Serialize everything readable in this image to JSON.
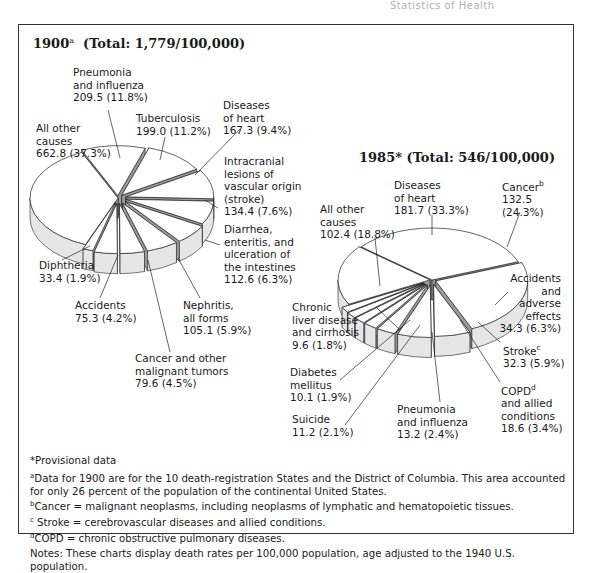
{
  "page_header": "Statistics of Health",
  "chart_data": [
    {
      "type": "pie",
      "title": "1900",
      "title_footnote": "a",
      "subtitle": "(Total: 1,779/100,000)",
      "total": 1779,
      "unit": "deaths per 100,000 population",
      "categories": [
        "All other causes",
        "Pneumonia and influenza",
        "Tuberculosis",
        "Diseases of heart",
        "Intracranial lesions of vascular origin (stroke)",
        "Diarrhea, enteritis, and ulceration of the intestines",
        "Nephritis, all forms",
        "Cancer and other malignant tumors",
        "Accidents",
        "Diphtheria"
      ],
      "values": [
        662.8,
        209.5,
        199.0,
        167.3,
        134.4,
        112.6,
        105.1,
        79.6,
        75.3,
        33.4
      ],
      "percent": [
        37.3,
        11.8,
        11.2,
        9.4,
        7.6,
        6.3,
        5.9,
        4.5,
        4.2,
        1.9
      ],
      "style": "3D exploded pie"
    },
    {
      "type": "pie",
      "title": "1985*",
      "subtitle": "(Total: 546/100,000)",
      "total": 546,
      "unit": "deaths per 100,000 population",
      "categories": [
        "Diseases of heart",
        "Cancer",
        "Accidents and adverse effects",
        "Stroke",
        "COPD and allied conditions",
        "Pneumonia and influenza",
        "Suicide",
        "Diabetes mellitus",
        "Chronic liver disease and cirrhosis",
        "All other causes"
      ],
      "values": [
        181.7,
        132.5,
        34.3,
        32.3,
        18.6,
        13.2,
        11.2,
        10.1,
        9.6,
        102.4
      ],
      "percent": [
        33.3,
        24.3,
        6.3,
        5.9,
        3.4,
        2.4,
        2.1,
        1.9,
        1.8,
        18.8
      ],
      "style": "3D exploded pie"
    }
  ],
  "chart1900": {
    "year": "1900",
    "footnote": "a",
    "total": "(Total: 1,779/100,000)",
    "labels": {
      "pneumonia": "Pneumonia\nand influenza\n209.5 (11.8%)",
      "tuberculosis": "Tuberculosis\n199.0 (11.2%)",
      "heart": "Diseases\nof heart\n167.3 (9.4%)",
      "other": "All other\ncauses\n662.8 (37.3%)",
      "stroke": "Intracranial\nlesions of\nvascular origin\n(stroke)\n134.4 (7.6%)",
      "diarrhea": "Diarrhea,\nenteritis, and\nulceration of\nthe intestines\n112.6 (6.3%)",
      "diphtheria": "Diphtheria\n33.4 (1.9%)",
      "accidents": "Accidents\n75.3 (4.2%)",
      "nephritis": "Nephritis,\nall forms\n105.1 (5.9%)",
      "cancer": "Cancer and other\nmalignant tumors\n79.6 (4.5%)"
    }
  },
  "chart1985": {
    "title": "1985* (Total: 546/100,000)",
    "labels": {
      "heart": "Diseases\nof heart\n181.7 (33.3%)",
      "cancer": "Cancer",
      "cancer_sup": "b",
      "cancer_val": "132.5\n(24.3%)",
      "other": "All other\ncauses\n102.4 (18.8%)",
      "accidents": "Accidents\nand\nadverse\neffects\n34.3 (6.3%)",
      "liver": "Chronic\nliver disease\nand cirrhosis\n9.6 (1.8%)",
      "stroke": "Stroke",
      "stroke_sup": "c",
      "stroke_val": "32.3 (5.9%)",
      "diabetes": "Diabetes\nmellitus\n10.1 (1.9%)",
      "copd": "COPD",
      "copd_sup": "d",
      "copd_val": "and allied\nconditions\n18.6 (3.4%)",
      "suicide": "Suicide\n11.2 (2.1%)",
      "pneumonia": "Pneumonia\nand influenza\n13.2 (2.4%)"
    }
  },
  "notes": {
    "provisional": "*Provisional data",
    "a_mark": "a",
    "a_text": "Data for 1900 are for the 10 death-registration States and the District of Columbia. This area accounted for only 26 percent of the population of the continental United States.",
    "b_mark": "b",
    "b_text": "Cancer = malignant neoplasms, including neoplasms of lymphatic and hematopoietic tissues.",
    "c_mark": "c",
    "c_text": " Stroke = cerebrovascular diseases and allied conditions.",
    "d_mark": "d",
    "d_text": "COPD = chronic obstructive pulmonary diseases.",
    "general": "Notes:  These charts display death rates per 100,000 population, age adjusted to the 1940  U.S. population."
  },
  "colors": {
    "face": "#ffffff",
    "side": "#e6e6e6",
    "cut": "#9a9a9a",
    "stroke": "#222222"
  }
}
